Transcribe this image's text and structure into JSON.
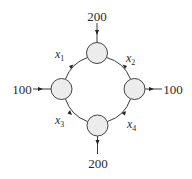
{
  "diagram": {
    "type": "flow-network",
    "nodes": [
      {
        "id": "top",
        "cx": 97,
        "cy": 53
      },
      {
        "id": "left",
        "cx": 61.5,
        "cy": 89
      },
      {
        "id": "right",
        "cx": 134.5,
        "cy": 89
      },
      {
        "id": "bottom",
        "cx": 97.5,
        "cy": 125.5
      }
    ],
    "node_radius": 10.5,
    "external_flows": {
      "top_in": "200",
      "left_in": "100",
      "right_out": "100",
      "bottom_out": "200"
    },
    "edges": [
      {
        "label_var": "x",
        "label_sub": "1",
        "from": "top",
        "to": "left"
      },
      {
        "label_var": "x",
        "label_sub": "2",
        "from": "top",
        "to": "right"
      },
      {
        "label_var": "x",
        "label_sub": "3",
        "from": "left",
        "to": "bottom"
      },
      {
        "label_var": "x",
        "label_sub": "4",
        "from": "bottom",
        "to": "right"
      }
    ]
  }
}
